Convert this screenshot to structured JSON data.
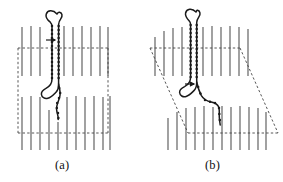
{
  "figure": {
    "type": "scientific-diagram",
    "panels": [
      {
        "id": "a",
        "caption": "(a)",
        "caption_x": 55,
        "caption_y": 158,
        "cell_shape": "rectangle",
        "cell": {
          "left": 18,
          "right": 108,
          "top": 48,
          "bottom": 133
        },
        "shear_offset": 0
      },
      {
        "id": "b",
        "caption": "(b)",
        "caption_x": 205,
        "caption_y": 158,
        "cell_shape": "parallelogram",
        "cell": {
          "left": 150,
          "right": 240,
          "top": 48,
          "bottom": 133
        },
        "shear_offset": 38
      }
    ],
    "colors": {
      "ink": "#1a1a1a",
      "obstacle": "#555555",
      "dashed_cell": "#444444",
      "background": "#ffffff"
    },
    "obstacles": {
      "label": "vertical-obstacle-lines",
      "count_per_row": 12,
      "spacing": 9,
      "upper_row": {
        "y_top": 26,
        "y_bottom": 76
      },
      "lower_row": {
        "y_top": 96,
        "y_bottom": 150
      }
    },
    "chain": {
      "label": "polymer-hairpin-chain",
      "style": "beaded-dotted",
      "bead_radius": 1.3,
      "a_points": [
        [
          57,
          14
        ],
        [
          54.5,
          11.5
        ],
        [
          51.5,
          10.5
        ],
        [
          48.5,
          11.5
        ],
        [
          46.5,
          14
        ],
        [
          46.5,
          17
        ],
        [
          48,
          19.5
        ],
        [
          50.5,
          21.5
        ],
        [
          52,
          24
        ],
        [
          52,
          27
        ],
        [
          52,
          31
        ],
        [
          52,
          35
        ],
        [
          52,
          39
        ],
        [
          52,
          43
        ],
        [
          52,
          47
        ],
        [
          52,
          51
        ],
        [
          52,
          55
        ],
        [
          52,
          59
        ],
        [
          52,
          63
        ],
        [
          52,
          67
        ],
        [
          52,
          71
        ],
        [
          52,
          75
        ],
        [
          52,
          79
        ],
        [
          51,
          83
        ],
        [
          49,
          86
        ],
        [
          46.5,
          88
        ],
        [
          44,
          89
        ],
        [
          42,
          91
        ],
        [
          41.5,
          94
        ],
        [
          42.5,
          97
        ],
        [
          45,
          98.5
        ],
        [
          48,
          98
        ],
        [
          50.5,
          96
        ],
        [
          52.5,
          94
        ],
        [
          55,
          92.5
        ],
        [
          57,
          90
        ],
        [
          58,
          87
        ],
        [
          58.5,
          84
        ],
        [
          58.5,
          80
        ],
        [
          58.5,
          76
        ],
        [
          58.5,
          72
        ],
        [
          58.5,
          68
        ],
        [
          58.5,
          64
        ],
        [
          58.5,
          60
        ],
        [
          58.5,
          56
        ],
        [
          58.5,
          52
        ],
        [
          58.5,
          48
        ],
        [
          58.5,
          44
        ],
        [
          58.5,
          40
        ],
        [
          58.5,
          36
        ],
        [
          58.5,
          32
        ],
        [
          58.5,
          28
        ],
        [
          58.5,
          24
        ],
        [
          59.5,
          21
        ],
        [
          61,
          18.5
        ],
        [
          62,
          16
        ],
        [
          61.5,
          13.5
        ],
        [
          59.5,
          12.5
        ],
        [
          57,
          14
        ]
      ],
      "a_tail": [
        [
          58.5,
          84
        ],
        [
          59.5,
          88
        ],
        [
          60.5,
          92
        ],
        [
          60,
          96
        ],
        [
          58.5,
          100
        ],
        [
          57,
          104
        ],
        [
          56.5,
          108
        ],
        [
          57.5,
          112
        ],
        [
          58.5,
          116
        ],
        [
          58,
          119
        ]
      ],
      "b_points": [
        [
          196,
          12
        ],
        [
          193,
          10
        ],
        [
          190,
          10
        ],
        [
          187.5,
          11.5
        ],
        [
          186.5,
          14
        ],
        [
          187,
          17
        ],
        [
          188.5,
          19.5
        ],
        [
          190,
          22
        ],
        [
          190.5,
          25
        ],
        [
          190.5,
          29
        ],
        [
          190.5,
          33
        ],
        [
          190.5,
          37
        ],
        [
          190.5,
          41
        ],
        [
          190.5,
          45
        ],
        [
          190.5,
          49
        ],
        [
          190.5,
          53
        ],
        [
          190.5,
          57
        ],
        [
          190.5,
          61
        ],
        [
          190.5,
          65
        ],
        [
          190.5,
          69
        ],
        [
          190.5,
          73
        ],
        [
          190,
          77
        ],
        [
          189,
          81
        ],
        [
          187,
          84
        ],
        [
          184.5,
          86
        ],
        [
          182,
          87
        ],
        [
          180,
          89
        ],
        [
          179.5,
          92
        ],
        [
          180.5,
          95
        ],
        [
          183,
          96.5
        ],
        [
          186,
          96
        ],
        [
          188.5,
          94
        ],
        [
          190.5,
          92
        ],
        [
          193,
          90
        ],
        [
          195,
          87.5
        ],
        [
          196,
          84.5
        ],
        [
          196.5,
          81
        ],
        [
          196.5,
          77
        ],
        [
          196.5,
          73
        ],
        [
          196.5,
          69
        ],
        [
          196.5,
          65
        ],
        [
          196.5,
          61
        ],
        [
          196.5,
          57
        ],
        [
          196.5,
          53
        ],
        [
          196.5,
          49
        ],
        [
          196.5,
          45
        ],
        [
          196.5,
          41
        ],
        [
          196.5,
          37
        ],
        [
          196.5,
          33
        ],
        [
          196.5,
          29
        ],
        [
          196.5,
          25
        ],
        [
          197.5,
          22
        ],
        [
          199,
          19
        ],
        [
          200,
          16
        ],
        [
          199.5,
          13
        ],
        [
          197.5,
          11.5
        ],
        [
          196,
          12
        ]
      ],
      "b_tail": [
        [
          196.5,
          84
        ],
        [
          198,
          88
        ],
        [
          199.5,
          92
        ],
        [
          201,
          96
        ],
        [
          203.5,
          99
        ],
        [
          207,
          101
        ],
        [
          210.5,
          102
        ],
        [
          214,
          102.5
        ],
        [
          217,
          104
        ],
        [
          218.5,
          107
        ],
        [
          219,
          111
        ],
        [
          219,
          115
        ],
        [
          219.5,
          119
        ],
        [
          220,
          122
        ]
      ]
    },
    "arrows": [
      {
        "panel": "a",
        "x1": 46,
        "y1": 40,
        "x2": 56,
        "y2": 40,
        "name": "force-arrow-a"
      },
      {
        "panel": "b",
        "x1": 185,
        "y1": 84,
        "x2": 195,
        "y2": 84,
        "name": "force-arrow-b"
      }
    ]
  }
}
